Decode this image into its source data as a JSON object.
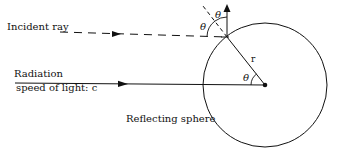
{
  "labels": {
    "incident_ray": "Incident ray",
    "radiation": "Radiation",
    "speed_of_light": "speed of light: c",
    "reflecting_sphere": "Reflecting sphere",
    "radius": "r",
    "theta": "θ"
  },
  "geometry": {
    "sphere_center": [
      265,
      85
    ],
    "sphere_radius": 62,
    "reflection_point": [
      227,
      37
    ],
    "colors": {
      "stroke": "#111111",
      "background": "#ffffff"
    }
  }
}
